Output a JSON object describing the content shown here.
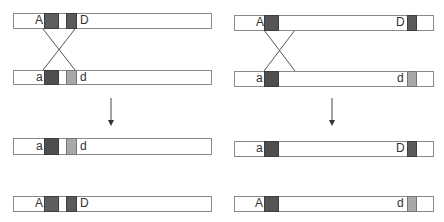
{
  "colors": {
    "dark_block": "#5a5a5a",
    "light_block": "#a8a8a8",
    "outline": "#8a8a8a",
    "line": "#555555"
  },
  "left_panel": {
    "description": "Crossover between A and D loci",
    "before": {
      "chromosome_1": {
        "left_label": "A",
        "right_label": "D"
      },
      "chromosome_2": {
        "left_label": "a",
        "right_label": "d"
      }
    },
    "after": {
      "chromosome_1": {
        "left_label": "a",
        "right_label": "d"
      },
      "chromosome_2": {
        "left_label": "A",
        "right_label": "D"
      }
    }
  },
  "right_panel": {
    "description": "Crossover near A locus, D far away",
    "before": {
      "chromosome_1": {
        "left_label": "A",
        "right_label": "D"
      },
      "chromosome_2": {
        "left_label": "a",
        "right_label": "d"
      }
    },
    "after": {
      "chromosome_1": {
        "left_label": "a",
        "right_label": "D"
      },
      "chromosome_2": {
        "left_label": "A",
        "right_label": "d"
      }
    }
  }
}
